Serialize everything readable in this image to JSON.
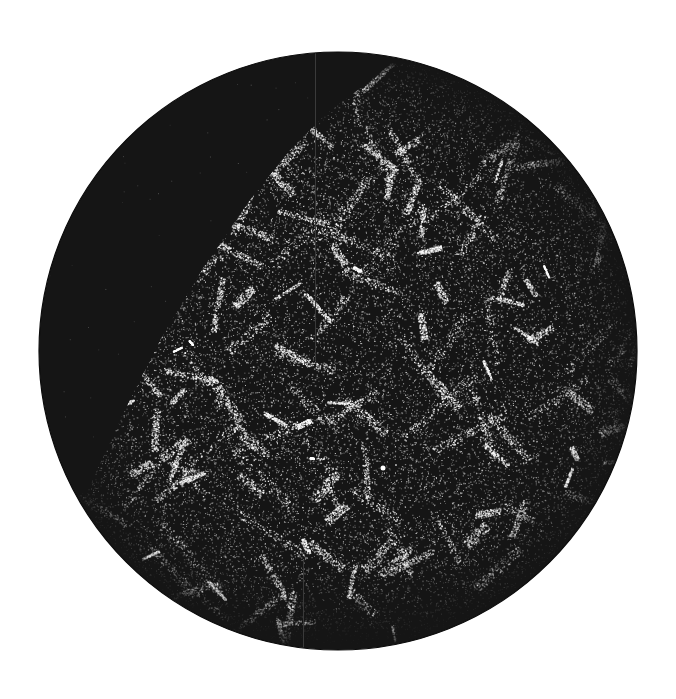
{
  "image": {
    "kind": "circular galaxy survey map (cosmic web)",
    "width": 676,
    "height": 699,
    "background_color": "#ffffff"
  },
  "disk": {
    "center_x": 338,
    "center_y": 351,
    "radius": 299,
    "fill_color": "#151515",
    "edge_color": "#0c0c0c"
  },
  "survey_region": {
    "description": "galaxy-populated area; upper-left wedge of the disk is empty (unsurveyed)",
    "boundary_points": [
      [
        88,
        490
      ],
      [
        120,
        420
      ],
      [
        160,
        340
      ],
      [
        205,
        265
      ],
      [
        250,
        200
      ],
      [
        290,
        150
      ],
      [
        325,
        115
      ],
      [
        360,
        88
      ]
    ],
    "point_color": "#ffffff",
    "point_density": 26000,
    "filament_count": 170
  },
  "artifacts": {
    "vertical_lines": [
      {
        "x": 315,
        "y_start": 52,
        "y_end": 360,
        "color": "#3a3a3a"
      },
      {
        "x": 303,
        "y_start": 560,
        "y_end": 651,
        "color": "#3a3a3a"
      }
    ],
    "bright_source": {
      "x": 383,
      "y": 468,
      "radius": 2.5,
      "color": "#ffffff"
    }
  }
}
